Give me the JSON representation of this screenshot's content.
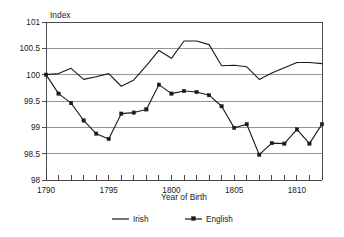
{
  "chart_data": {
    "type": "line",
    "title": "",
    "ylabel": "Index",
    "xlabel": "Year of Birth",
    "x": [
      1790,
      1791,
      1792,
      1793,
      1794,
      1795,
      1796,
      1797,
      1798,
      1799,
      1800,
      1801,
      1802,
      1803,
      1804,
      1805,
      1806,
      1807,
      1808,
      1809,
      1810,
      1811,
      1812
    ],
    "xlim": [
      1790,
      1812
    ],
    "ylim": [
      98,
      101
    ],
    "xticks": [
      1790,
      1791,
      1792,
      1793,
      1794,
      1795,
      1796,
      1797,
      1798,
      1799,
      1800,
      1801,
      1802,
      1803,
      1804,
      1805,
      1806,
      1807,
      1808,
      1809,
      1810,
      1811,
      1812
    ],
    "xtick_labels": [
      "1790",
      "",
      "",
      "",
      "",
      "1795",
      "",
      "",
      "",
      "",
      "1800",
      "",
      "",
      "",
      "",
      "1805",
      "",
      "",
      "",
      "",
      "1810",
      "",
      ""
    ],
    "yticks": [
      98,
      98.5,
      99,
      99.5,
      100,
      100.5,
      101
    ],
    "ytick_labels": [
      "98",
      "98.5",
      "99",
      "99.5",
      "100",
      "100.5",
      "101"
    ],
    "grid": "horizontal",
    "legend_position": "bottom-center",
    "series": [
      {
        "name": "Irish",
        "marker": "none",
        "color": "#1a1a1a",
        "values": [
          100.0,
          100.02,
          100.12,
          99.91,
          99.96,
          100.02,
          99.78,
          99.9,
          100.17,
          100.46,
          100.31,
          100.64,
          100.64,
          100.57,
          100.17,
          100.18,
          100.15,
          99.91,
          100.03,
          100.13,
          100.23,
          100.23,
          100.21
        ]
      },
      {
        "name": "English",
        "marker": "square",
        "color": "#1a1a1a",
        "values": [
          100.0,
          99.64,
          99.46,
          99.13,
          98.88,
          98.78,
          99.26,
          99.28,
          99.34,
          99.81,
          99.64,
          99.69,
          99.67,
          99.61,
          99.4,
          98.99,
          99.06,
          98.48,
          98.7,
          98.69,
          98.96,
          98.69,
          99.06
        ]
      }
    ]
  },
  "legend": {
    "items": [
      {
        "label": "Irish"
      },
      {
        "label": "English"
      }
    ]
  },
  "axis": {
    "y_title": "Index",
    "x_title": "Year of Birth"
  }
}
